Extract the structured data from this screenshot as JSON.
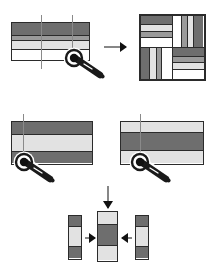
{
  "figure": {
    "background_color": "#ffffff",
    "line_color": "#2b2b2b",
    "guide_color": "#8a8a8a",
    "palette": {
      "dark_fabric": "#6e6e6e",
      "medium_fabric": "#9a9a9a",
      "light_fabric": "#e2e2e2",
      "white_fabric": "#ffffff"
    }
  },
  "step1": {
    "label": "Step 1",
    "source_stripset": {
      "name": "four-band strip set",
      "orientation": "horizontal",
      "bands": [
        {
          "tone": "dark",
          "color": "#6e6e6e",
          "height_pct": 34
        },
        {
          "tone": "medium",
          "color": "#9a9a9a",
          "height_pct": 16
        },
        {
          "tone": "light",
          "color": "#e2e2e2",
          "height_pct": 24
        },
        {
          "tone": "white",
          "color": "#ffffff",
          "height_pct": 26
        }
      ],
      "cut_guides": [
        {
          "axis": "vertical",
          "position_pct": 38
        },
        {
          "axis": "vertical",
          "position_pct": 70
        }
      ]
    },
    "arrow": {
      "direction": "right",
      "name": "transform-arrow"
    },
    "result_block": {
      "name": "pinwheel log-cabin block",
      "quadrants": [
        {
          "position": "top-left",
          "orientation": "horizontal",
          "bands": [
            {
              "tone": "dark",
              "color": "#6e6e6e",
              "size_pct": 30
            },
            {
              "tone": "light",
              "color": "#e2e2e2",
              "size_pct": 22
            },
            {
              "tone": "medium",
              "color": "#9a9a9a",
              "size_pct": 18
            },
            {
              "tone": "white",
              "color": "#ffffff",
              "size_pct": 30
            }
          ]
        },
        {
          "position": "top-right",
          "orientation": "vertical",
          "bands": [
            {
              "tone": "white",
              "color": "#ffffff",
              "size_pct": 30
            },
            {
              "tone": "medium",
              "color": "#9a9a9a",
              "size_pct": 18
            },
            {
              "tone": "light",
              "color": "#e2e2e2",
              "size_pct": 22
            },
            {
              "tone": "dark",
              "color": "#6e6e6e",
              "size_pct": 30
            }
          ]
        },
        {
          "position": "bottom-left",
          "orientation": "vertical",
          "bands": [
            {
              "tone": "dark",
              "color": "#6e6e6e",
              "size_pct": 30
            },
            {
              "tone": "light",
              "color": "#e2e2e2",
              "size_pct": 22
            },
            {
              "tone": "medium",
              "color": "#9a9a9a",
              "size_pct": 18
            },
            {
              "tone": "white",
              "color": "#ffffff",
              "size_pct": 30
            }
          ]
        },
        {
          "position": "bottom-right",
          "orientation": "horizontal",
          "bands": [
            {
              "tone": "dark",
              "color": "#6e6e6e",
              "size_pct": 30
            },
            {
              "tone": "medium",
              "color": "#9a9a9a",
              "size_pct": 18
            },
            {
              "tone": "light",
              "color": "#e2e2e2",
              "size_pct": 22
            },
            {
              "tone": "white",
              "color": "#ffffff",
              "size_pct": 30
            }
          ]
        }
      ]
    }
  },
  "step2": {
    "label": "Step 2",
    "left_stripset": {
      "name": "dark-light-dark strip set",
      "orientation": "horizontal",
      "bands": [
        {
          "tone": "dark",
          "color": "#6e6e6e",
          "height_pct": 30
        },
        {
          "tone": "light",
          "color": "#e2e2e2",
          "height_pct": 42
        },
        {
          "tone": "dark",
          "color": "#6e6e6e",
          "height_pct": 28
        }
      ],
      "cut_guides": [
        {
          "axis": "vertical",
          "position_pct": 16
        }
      ]
    },
    "right_stripset": {
      "name": "light-dark-light strip set",
      "orientation": "horizontal",
      "bands": [
        {
          "tone": "light",
          "color": "#e2e2e2",
          "height_pct": 26
        },
        {
          "tone": "dark",
          "color": "#6e6e6e",
          "height_pct": 44
        },
        {
          "tone": "light",
          "color": "#e2e2e2",
          "height_pct": 30
        }
      ],
      "cut_guides": [
        {
          "axis": "vertical",
          "position_pct": 22
        }
      ]
    },
    "arrow": {
      "direction": "down",
      "name": "assembly-arrow"
    }
  },
  "step3": {
    "label": "Step 3",
    "left_segment": {
      "name": "dark-light-dark segment",
      "bands": [
        {
          "tone": "dark",
          "color": "#6e6e6e",
          "height_pct": 26
        },
        {
          "tone": "light",
          "color": "#e2e2e2",
          "height_pct": 46
        },
        {
          "tone": "dark",
          "color": "#6e6e6e",
          "height_pct": 28
        }
      ]
    },
    "center_segment": {
      "name": "light-dark-light segment",
      "bands": [
        {
          "tone": "light",
          "color": "#e2e2e2",
          "height_pct": 26
        },
        {
          "tone": "dark",
          "color": "#6e6e6e",
          "height_pct": 44
        },
        {
          "tone": "light",
          "color": "#e2e2e2",
          "height_pct": 30
        }
      ]
    },
    "right_segment": {
      "name": "dark-light-dark segment",
      "bands": [
        {
          "tone": "dark",
          "color": "#6e6e6e",
          "height_pct": 26
        },
        {
          "tone": "light",
          "color": "#e2e2e2",
          "height_pct": 46
        },
        {
          "tone": "dark",
          "color": "#6e6e6e",
          "height_pct": 28
        }
      ]
    },
    "join_arrow_left": {
      "direction": "right",
      "name": "join-arrow-left"
    },
    "join_arrow_right": {
      "direction": "left",
      "name": "join-arrow-right"
    }
  },
  "tools": [
    {
      "name": "rotary-cutter",
      "step": "step1",
      "x": 62,
      "y": 52,
      "rotation": 0
    },
    {
      "name": "rotary-cutter",
      "step": "step2-left",
      "x": 12,
      "y": 148,
      "rotation": 0
    },
    {
      "name": "rotary-cutter",
      "step": "step2-right",
      "x": 122,
      "y": 150,
      "rotation": 0
    }
  ]
}
